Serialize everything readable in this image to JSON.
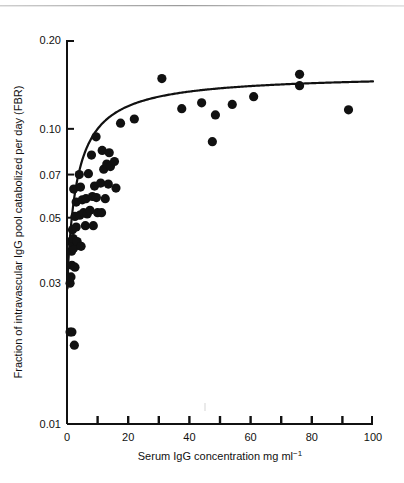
{
  "figure": {
    "name": "serum-igg-fbr-scatter",
    "background_color": "#ffffff",
    "ink_color": "#111111",
    "top_rule_color": "#9b9b9b"
  },
  "chart_data": {
    "type": "scatter",
    "title": "",
    "subtitle": "",
    "xlabel": "Serum IgG concentration mg ml",
    "xlabel_superscript": "−1",
    "ylabel": "Fraction of intravascular IgG pool catabolized per day (FBR)",
    "xscale": "linear",
    "yscale": "log",
    "xlim": [
      0,
      100
    ],
    "ylim": [
      0.01,
      0.2
    ],
    "grid": false,
    "legend": null,
    "xticks": [
      0,
      10,
      20,
      30,
      40,
      50,
      60,
      70,
      80,
      90,
      100
    ],
    "xtick_labels": [
      "0",
      "",
      "20",
      "",
      "40",
      "",
      "60",
      "",
      "80",
      "",
      "100"
    ],
    "yticks": [
      0.01,
      0.03,
      0.05,
      0.07,
      0.1,
      0.2
    ],
    "ytick_labels": [
      "0.01",
      "0.03",
      "0.05",
      "0.07",
      "0.10",
      "0.20"
    ],
    "marker": "filled-circle",
    "marker_color": "#111111",
    "marker_size_px": 4.6,
    "points": [
      [
        1.0,
        0.0205
      ],
      [
        1.6,
        0.0205
      ],
      [
        2.4,
        0.0185
      ],
      [
        1.0,
        0.03
      ],
      [
        1.3,
        0.0315
      ],
      [
        1.6,
        0.0345
      ],
      [
        2.6,
        0.034
      ],
      [
        1.5,
        0.0385
      ],
      [
        2.2,
        0.0395
      ],
      [
        1.2,
        0.0415
      ],
      [
        2.0,
        0.0425
      ],
      [
        3.3,
        0.0415
      ],
      [
        4.6,
        0.04
      ],
      [
        1.8,
        0.0455
      ],
      [
        3.0,
        0.0465
      ],
      [
        6.0,
        0.047
      ],
      [
        8.6,
        0.047
      ],
      [
        2.6,
        0.0505
      ],
      [
        4.2,
        0.051
      ],
      [
        5.4,
        0.052
      ],
      [
        6.6,
        0.0515
      ],
      [
        7.5,
        0.053
      ],
      [
        10.0,
        0.052
      ],
      [
        11.3,
        0.052
      ],
      [
        3.0,
        0.0565
      ],
      [
        5.0,
        0.0575
      ],
      [
        6.2,
        0.058
      ],
      [
        8.3,
        0.059
      ],
      [
        9.6,
        0.0585
      ],
      [
        12.5,
        0.058
      ],
      [
        2.2,
        0.0625
      ],
      [
        4.4,
        0.0635
      ],
      [
        9.0,
        0.064
      ],
      [
        11.0,
        0.0655
      ],
      [
        13.5,
        0.065
      ],
      [
        16.0,
        0.063
      ],
      [
        4.0,
        0.07
      ],
      [
        7.0,
        0.0705
      ],
      [
        12.0,
        0.073
      ],
      [
        13.0,
        0.076
      ],
      [
        14.2,
        0.0745
      ],
      [
        15.5,
        0.0775
      ],
      [
        8.0,
        0.0815
      ],
      [
        11.5,
        0.0845
      ],
      [
        13.8,
        0.083
      ],
      [
        9.5,
        0.094
      ],
      [
        17.5,
        0.1045
      ],
      [
        22.0,
        0.108
      ],
      [
        31.0,
        0.148
      ],
      [
        37.5,
        0.117
      ],
      [
        44.0,
        0.1225
      ],
      [
        47.5,
        0.0905
      ],
      [
        48.5,
        0.1115
      ],
      [
        54.0,
        0.121
      ],
      [
        61.0,
        0.1285
      ],
      [
        76.0,
        0.153
      ],
      [
        76.0,
        0.14
      ],
      [
        92.0,
        0.116
      ]
    ],
    "fit_curve": {
      "name": "saturation-fit",
      "color": "#111111",
      "line_width_px": 2.2,
      "description": "rectangular hyperbola rising from 0.029 at low concentration to an asymptote near 0.145",
      "model": "y = ymax * x / (k + x) + y0",
      "params": {
        "y0": 0.0285,
        "ymax": 0.125,
        "k": 7.5
      },
      "x_range": [
        0.4,
        100
      ]
    }
  }
}
